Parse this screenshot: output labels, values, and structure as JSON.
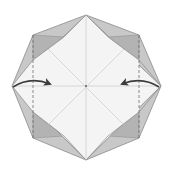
{
  "diagram": {
    "type": "origami-fold-step",
    "colors": {
      "background": "#ffffff",
      "paper_front": "#f4f4f4",
      "flap_light": "#c8c8c8",
      "flap_dark": "#adadad",
      "edge": "#8a8a8a",
      "crease": "#bdbdbd",
      "arrow": "#3c3c3c",
      "dashed_line": "#6e6e6e"
    },
    "octagon_vertices": [
      [
        86,
        15
      ],
      [
        139,
        35
      ],
      [
        161,
        86
      ],
      [
        139,
        138
      ],
      [
        86,
        160
      ],
      [
        33,
        138
      ],
      [
        12,
        86
      ],
      [
        33,
        35
      ]
    ],
    "center": [
      86,
      87
    ],
    "arrows": [
      {
        "name": "left-fold-arrow",
        "from": [
          14,
          86
        ],
        "to": [
          52,
          84
        ],
        "direction": "right"
      },
      {
        "name": "right-fold-arrow",
        "from": [
          159,
          86
        ],
        "to": [
          120,
          84
        ],
        "direction": "left"
      }
    ],
    "valley_lines": [
      {
        "name": "left-valley-fold",
        "x": 33
      },
      {
        "name": "right-valley-fold",
        "x": 139
      }
    ]
  }
}
